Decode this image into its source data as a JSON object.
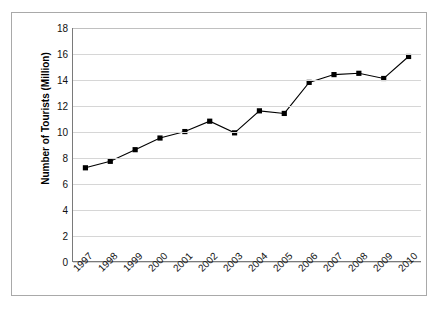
{
  "chart_data": {
    "type": "line",
    "title": "",
    "subtitle": "",
    "xlabel": "",
    "ylabel": "Number of Tourists (Million)",
    "categories": [
      "1997",
      "1998",
      "1999",
      "2000",
      "2001",
      "2002",
      "2003",
      "2004",
      "2005",
      "2006",
      "2007",
      "2008",
      "2009",
      "2010"
    ],
    "values": [
      7.2,
      7.7,
      8.6,
      9.5,
      10.0,
      10.8,
      9.9,
      11.6,
      11.4,
      13.8,
      14.4,
      14.5,
      14.1,
      15.8
    ],
    "ylim": [
      0,
      18
    ],
    "ytick_step": 2,
    "yticks": [
      "18",
      "16",
      "14",
      "12",
      "10",
      "8",
      "6",
      "4",
      "2",
      "0"
    ],
    "grid": "horizontal",
    "legend": "none",
    "series_color": "#000000",
    "marker": "square",
    "gridline_color": "#d6d6d6",
    "axis_color": "#7a7a7a",
    "frame_color": "#a9a9a9",
    "background": "#ffffff"
  }
}
